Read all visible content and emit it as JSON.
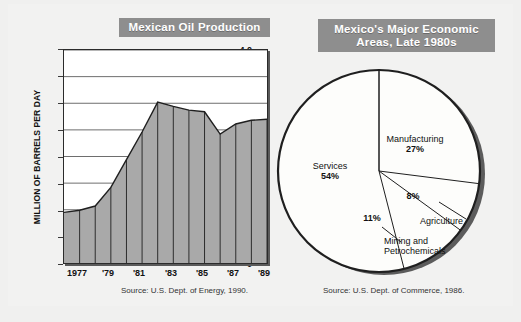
{
  "left": {
    "title": "Mexican Oil Production",
    "source": "Source: U.S. Dept. of Energy, 1990."
  },
  "right": {
    "title_line1": "Mexico's Major Economic",
    "title_line2": "Areas, Late 1980s",
    "source": "Source: U.S. Dept. of Commerce, 1986."
  },
  "colors": {
    "title_bar": "#8e8e8e",
    "area_fill": "#a9a9a9",
    "pie_fill": "#fdfdfb",
    "pie_shadow": "#5c5c5c",
    "outline": "#1f1f1f"
  },
  "chart_data": [
    {
      "type": "area",
      "title": "Mexican Oil Production",
      "xlabel": "",
      "ylabel": "MILLION OF BARRELS PER DAY",
      "ylim": [
        0,
        4.0
      ],
      "yticks": [
        "0",
        "0.5",
        "1.0",
        "1.5",
        "2.0",
        "2.5",
        "3.0",
        "3.5",
        "4.0"
      ],
      "ytick_values": [
        0,
        0.5,
        1.0,
        1.5,
        2.0,
        2.5,
        3.0,
        3.5,
        4.0
      ],
      "xticks": [
        "1977",
        "'79",
        "'81",
        "'83",
        "'85",
        "'87",
        "'89"
      ],
      "xtick_values": [
        1977,
        1979,
        1981,
        1983,
        1985,
        1987,
        1989
      ],
      "grid": true,
      "x": [
        1976,
        1977,
        1978,
        1979,
        1980,
        1981,
        1982,
        1983,
        1984,
        1985,
        1986,
        1987,
        1988,
        1989
      ],
      "values": [
        0.95,
        0.99,
        1.07,
        1.42,
        1.94,
        2.46,
        3.02,
        2.94,
        2.87,
        2.84,
        2.42,
        2.61,
        2.68,
        2.7
      ],
      "source": "Source: U.S. Dept. of Energy, 1990."
    },
    {
      "type": "pie",
      "title": "Mexico's Major Economic Areas, Late 1980s",
      "categories": [
        "Services",
        "Manufacturing",
        "Mining and Petrochemicals",
        "Agriculture"
      ],
      "values": [
        54,
        27,
        11,
        8
      ],
      "labels": [
        {
          "name": "Services",
          "pct": "54%"
        },
        {
          "name": "Manufacturing",
          "pct": "27%"
        },
        {
          "name": "Mining and Petrochemicals",
          "pct": "11%"
        },
        {
          "name": "Agriculture",
          "pct": "8%"
        }
      ],
      "source": "Source: U.S. Dept. of Commerce, 1986."
    }
  ],
  "pie_label_text": {
    "services_name": "Services",
    "services_pct": "54%",
    "manufacturing_name": "Manufacturing",
    "manufacturing_pct": "27%",
    "mining_pct": "11%",
    "mining_name_l1": "Mining and",
    "mining_name_l2": "Petrochemicals",
    "agriculture_pct": "8%",
    "agriculture_name": "Agriculture"
  },
  "axis_text": {
    "y_title": "MILLION OF BARRELS PER DAY",
    "y0": "0",
    "y1": "0.5",
    "y2": "1.0",
    "y3": "1.5",
    "y4": "2.0",
    "y5": "2.5",
    "y6": "3.0",
    "y7": "3.5",
    "y8": "4.0",
    "x0": "1977",
    "x1": "'79",
    "x2": "'81",
    "x3": "'83",
    "x4": "'85",
    "x5": "'87",
    "x6": "'89"
  }
}
